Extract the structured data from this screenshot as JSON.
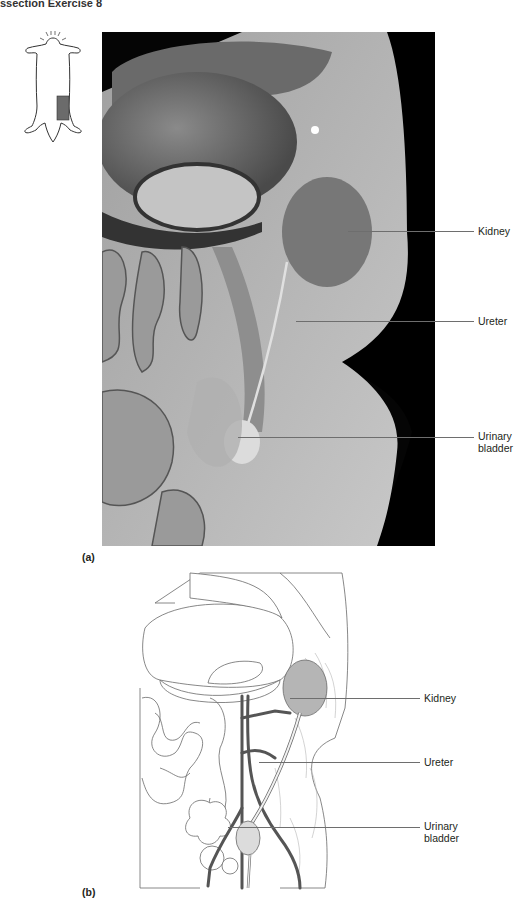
{
  "header": {
    "title": "ssection Exercise 8"
  },
  "orientation_icon": {
    "name": "cat-body-outline",
    "highlight_color": "#6b6b6b"
  },
  "panel_a": {
    "letter": "(a)",
    "type": "photograph",
    "labels": [
      {
        "id": "kidney",
        "text": "Kidney"
      },
      {
        "id": "ureter",
        "text": "Ureter"
      },
      {
        "id": "urinary-bladder",
        "line1": "Urinary",
        "line2": "bladder"
      }
    ]
  },
  "panel_b": {
    "letter": "(b)",
    "type": "line-drawing",
    "colors": {
      "kidney_fill": "#b5b5b5",
      "vessel": "#555555",
      "outline": "#6a6a6a"
    },
    "labels": [
      {
        "id": "kidney",
        "text": "Kidney"
      },
      {
        "id": "ureter",
        "text": "Ureter"
      },
      {
        "id": "urinary-bladder",
        "line1": "Urinary",
        "line2": "bladder"
      }
    ]
  }
}
